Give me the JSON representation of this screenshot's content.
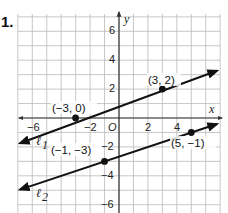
{
  "problem": {
    "number": "1."
  },
  "chart_data": {
    "type": "line",
    "title": "",
    "xlabel": "x",
    "ylabel": "y",
    "xlim": [
      -7,
      7
    ],
    "ylim": [
      -6.6,
      7
    ],
    "grid": true,
    "x_ticks": [
      {
        "value": -6,
        "label": "−6"
      },
      {
        "value": -2,
        "label": "−2"
      },
      {
        "value": 0,
        "label": "O"
      },
      {
        "value": 2,
        "label": "2"
      },
      {
        "value": 4,
        "label": "4"
      }
    ],
    "y_ticks": [
      {
        "value": 6,
        "label": "6"
      },
      {
        "value": 4,
        "label": "4"
      },
      {
        "value": 2,
        "label": "2"
      },
      {
        "value": -2,
        "label": "−2"
      },
      {
        "value": -4,
        "label": "−4"
      },
      {
        "value": -6,
        "label": "−6"
      }
    ],
    "series": [
      {
        "name": "ℓ1",
        "label": "ℓ1",
        "slope": 0.3333,
        "points": [
          {
            "x": -3,
            "y": 0,
            "label": "(−3, 0)"
          },
          {
            "x": 3,
            "y": 2,
            "label": "(3, 2)"
          }
        ],
        "x_range": [
          -7,
          6.9
        ]
      },
      {
        "name": "ℓ2",
        "label": "ℓ2",
        "slope": 0.3333,
        "points": [
          {
            "x": -1,
            "y": -3,
            "label": "(−1, −3)"
          },
          {
            "x": 5,
            "y": -1,
            "label": "(5, −1)"
          }
        ],
        "x_range": [
          -7,
          6.9
        ]
      }
    ]
  },
  "labels": {
    "l1": "ℓ1",
    "l2": "ℓ2",
    "l1_name": "ℓ",
    "l1_sub": "1",
    "l2_name": "ℓ",
    "l2_sub": "2",
    "p1": "(−3, 0)",
    "p2": "(3, 2)",
    "p3": "(−1, −3)",
    "p4": "(5, −1)",
    "x_axis": "x",
    "y_axis": "y",
    "tick_x_neg6": "−6",
    "tick_x_neg2": "−2",
    "tick_origin": "O",
    "tick_x_2": "2",
    "tick_x_4": "4",
    "tick_y_6": "6",
    "tick_y_4": "4",
    "tick_y_2": "2",
    "tick_y_neg2": "−2",
    "tick_y_neg4": "−4",
    "tick_y_neg6": "−6"
  }
}
